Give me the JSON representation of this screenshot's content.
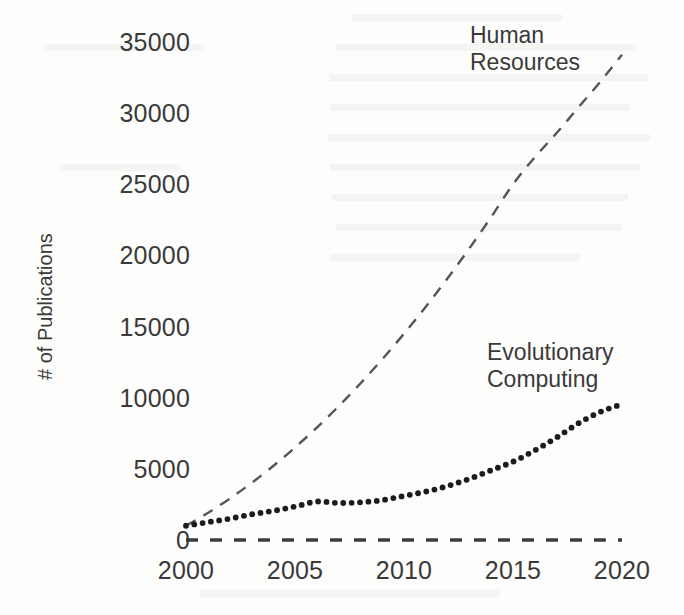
{
  "chart_data": {
    "type": "line",
    "title": "",
    "subtitle": "",
    "xlabel": "",
    "ylabel": "# of Publications",
    "xlim": [
      2000,
      2020
    ],
    "ylim": [
      0,
      35000
    ],
    "grid": false,
    "legend_position": "inline-annotations",
    "x_tick_labels": [
      "2000",
      "2005",
      "2010",
      "2015",
      "2020"
    ],
    "x_ticks": [
      2000,
      2005,
      2010,
      2015,
      2020
    ],
    "y_tick_labels": [
      "0",
      "5000",
      "10000",
      "15000",
      "20000",
      "25000",
      "30000",
      "35000"
    ],
    "y_ticks": [
      0,
      5000,
      10000,
      15000,
      20000,
      25000,
      30000,
      35000
    ],
    "x": [
      2000,
      2001,
      2002,
      2003,
      2004,
      2005,
      2006,
      2007,
      2008,
      2009,
      2010,
      2011,
      2012,
      2013,
      2014,
      2015,
      2016,
      2017,
      2018,
      2019,
      2020
    ],
    "series": [
      {
        "name": "Human Resources",
        "style": "dashed",
        "color": "#555555",
        "values": [
          1000,
          1900,
          2900,
          4000,
          5200,
          6500,
          7900,
          9400,
          11000,
          12700,
          14500,
          16400,
          18400,
          20500,
          22700,
          25000,
          26900,
          28600,
          30400,
          32200,
          34100
        ]
      },
      {
        "name": "Evolutionary Computing",
        "style": "dotted",
        "color": "#1c1c1c",
        "values": [
          1000,
          1250,
          1500,
          1800,
          2050,
          2350,
          2700,
          2600,
          2650,
          2800,
          3100,
          3400,
          3800,
          4300,
          4900,
          5500,
          6300,
          7200,
          8200,
          9000,
          9550
        ]
      },
      {
        "name": "baseline",
        "style": "dashed",
        "color": "#3a3a3a",
        "values": [
          0,
          0,
          0,
          0,
          0,
          0,
          0,
          0,
          0,
          0,
          0,
          0,
          0,
          0,
          0,
          0,
          0,
          0,
          0,
          0,
          0
        ]
      }
    ],
    "annotations": [
      {
        "text_line1": "Human",
        "text_line2": "Resources"
      },
      {
        "text_line1": "Evolutionary",
        "text_line2": "Computing"
      }
    ]
  },
  "axis": {
    "y_label": "# of Publications",
    "y_ticks": [
      {
        "label": "35000"
      },
      {
        "label": "30000"
      },
      {
        "label": "25000"
      },
      {
        "label": "20000"
      },
      {
        "label": "15000"
      },
      {
        "label": "10000"
      },
      {
        "label": "5000"
      },
      {
        "label": "0"
      }
    ],
    "x_ticks": [
      {
        "label": "2000"
      },
      {
        "label": "2005"
      },
      {
        "label": "2010"
      },
      {
        "label": "2015"
      },
      {
        "label": "2020"
      }
    ]
  },
  "labels": {
    "hr_line1": "Human",
    "hr_line2": "Resources",
    "ec_line1": "Evolutionary",
    "ec_line2": "Computing"
  }
}
